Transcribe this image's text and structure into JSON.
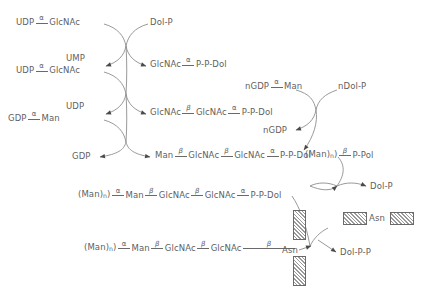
{
  "diagram": {
    "line_color": "#6a6a6a",
    "text_color": "#5f5f5f",
    "background": "#ffffff",
    "greek": {
      "alpha": "α",
      "beta": "β"
    },
    "subscript_n": "n"
  },
  "labels": {
    "udp_glcnac_1_a": "UDP",
    "udp_glcnac_1_b": "GlcNAc",
    "dol_p_top": "Dol-P",
    "ump": "UMP",
    "udp_glcnac_2_a": "UDP",
    "udp_glcnac_2_b": "GlcNAc",
    "glcnac_ppdol_1": "GlcNAc",
    "glcnac_ppdol_1_p": "P-P-Dol",
    "udp": "UDP",
    "gdp_man_a": "GDP",
    "gdp_man_b": "Man",
    "chitobiose_1": "GlcNAc",
    "chitobiose_2": "GlcNAc",
    "chitobiose_p": "P-P-Dol",
    "gdp": "GDP",
    "man_chain_man": "Man",
    "man_chain_1": "GlcNAc",
    "man_chain_2": "GlcNAc",
    "man_chain_p": "P-P-Dol",
    "ngdp_man_a": "nGDP",
    "ngdp_man_b": "Man",
    "ndol_p": "nDol-P",
    "ngdp": "nGDP",
    "man_n_ppol_a": "(Man)",
    "man_n_ppol_b": "P-Pol",
    "row5_man_n": "(Man)",
    "row5_man": "Man",
    "row5_glcnac_1": "GlcNAc",
    "row5_glcnac_2": "GlcNAc",
    "row5_p": "P-P-Dol",
    "dol_p_right": "Dol-P",
    "row6_man_n": "(Man)",
    "row6_man": "Man",
    "row6_glcnac_1": "GlcNAc",
    "row6_glcnac_2": "GlcNAc",
    "asn": "Asn",
    "dol_pp": "Dol-P-P",
    "legend_asn": "Asn"
  }
}
